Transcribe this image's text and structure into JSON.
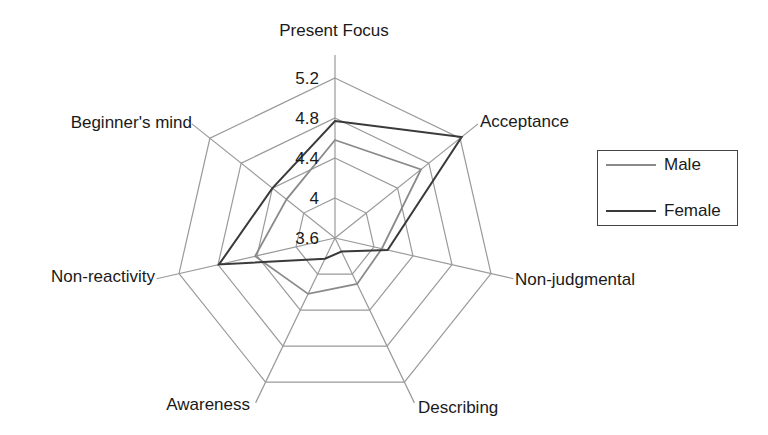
{
  "chart_data": {
    "type": "radar",
    "title": "",
    "axes": [
      "Present Focus",
      "Acceptance",
      "Non-judgmental",
      "Describing",
      "Awareness",
      "Non-reactivity",
      "Beginner's mind"
    ],
    "tick_labels": [
      "3.6",
      "4",
      "4.4",
      "4.8",
      "5.2"
    ],
    "ticks": [
      3.6,
      4.0,
      4.4,
      4.8,
      5.2
    ],
    "range": [
      3.6,
      5.2
    ],
    "grid": true,
    "legend_position": "right",
    "series": [
      {
        "name": "Male",
        "color": "#8a8a8a",
        "values": [
          4.58,
          4.7,
          4.08,
          4.11,
          4.22,
          4.42,
          4.22
        ]
      },
      {
        "name": "Female",
        "color": "#3a3a3a",
        "values": [
          4.77,
          5.22,
          4.14,
          3.75,
          3.83,
          4.79,
          4.4
        ]
      }
    ]
  },
  "legend": {
    "items": [
      {
        "label": "Male",
        "color": "#8a8a8a"
      },
      {
        "label": "Female",
        "color": "#3a3a3a"
      }
    ]
  },
  "style": {
    "grid_color": "#9a9a9a"
  }
}
